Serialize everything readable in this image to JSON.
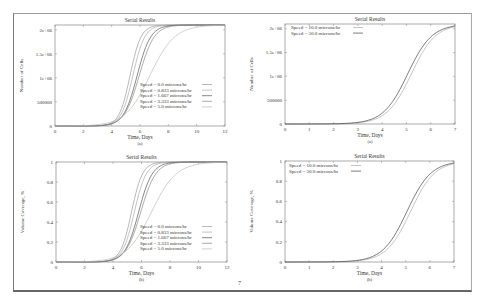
{
  "page": {
    "number": "7"
  },
  "chart_data": [
    {
      "id": "a",
      "type": "line",
      "title": "Serial Results",
      "xlabel": "Time, Days",
      "ylabel": "Number of Cells",
      "caption": "(a)",
      "xlim": [
        0,
        12
      ],
      "ylim": [
        0,
        2100000
      ],
      "xticks": [
        0,
        2,
        4,
        6,
        8,
        10,
        12
      ],
      "yticks": [
        {
          "v": 0,
          "label": "0"
        },
        {
          "v": 500000,
          "label": "500000"
        },
        {
          "v": 1000000,
          "label": "1e+06"
        },
        {
          "v": 1500000,
          "label": "1.5e+06"
        },
        {
          "v": 2000000,
          "label": "2e+06"
        }
      ],
      "legend_position": "lower right",
      "box": {
        "x": 55,
        "y": 25,
        "w": 170,
        "h": 101
      },
      "legend_box": {
        "x": 140,
        "y": 86
      },
      "series": [
        {
          "name": "Speed =  0.0  microns/hr",
          "max": 2100000,
          "mid": 5.3,
          "k": 2.6,
          "color": "#999"
        },
        {
          "name": "Speed = 0.833 microns/hr",
          "max": 2100000,
          "mid": 5.5,
          "k": 2.4,
          "color": "#aaa"
        },
        {
          "name": "Speed = 1.667 microns/hr",
          "max": 2100000,
          "mid": 5.8,
          "k": 2.1,
          "color": "#555"
        },
        {
          "name": "Speed = 3.333 microns/hr",
          "max": 2100000,
          "mid": 5.95,
          "k": 1.9,
          "color": "#888"
        },
        {
          "name": "Speed =  5.0  microns/hr",
          "max": 2100000,
          "mid": 6.7,
          "k": 1.15,
          "color": "#bbb"
        }
      ]
    },
    {
      "id": "c",
      "type": "line",
      "title": "Serial Results",
      "xlabel": "Time, Days",
      "ylabel": "Number of Cells",
      "caption": "(a)",
      "xlim": [
        0,
        7
      ],
      "ylim": [
        0,
        2100000
      ],
      "xticks": [
        0,
        1,
        2,
        3,
        4,
        5,
        6,
        7
      ],
      "yticks": [
        {
          "v": 0,
          "label": "0"
        },
        {
          "v": 500000,
          "label": "500000"
        },
        {
          "v": 1000000,
          "label": "1e+06"
        },
        {
          "v": 1500000,
          "label": "1.5e+06"
        },
        {
          "v": 2000000,
          "label": "2e+06"
        }
      ],
      "legend_position": "upper left",
      "box": {
        "x": 285,
        "y": 24,
        "w": 170,
        "h": 100
      },
      "legend_box": {
        "x": 291,
        "y": 29
      },
      "series": [
        {
          "name": "Speed = 10.0  microns/hr",
          "max": 2100000,
          "mid": 5.2,
          "k": 2.0,
          "color": "#aaa"
        },
        {
          "name": "Speed = 50.0  microns/hr",
          "max": 2100000,
          "mid": 5.05,
          "k": 2.0,
          "color": "#444"
        }
      ]
    },
    {
      "id": "b",
      "type": "line",
      "title": "Serial Results",
      "xlabel": "Time, Days",
      "ylabel": "Volume Coverage, %",
      "caption": "(b)",
      "xlim": [
        0,
        12
      ],
      "ylim": [
        0,
        1
      ],
      "xticks": [
        0,
        2,
        4,
        6,
        8,
        10,
        12
      ],
      "yticks": [
        {
          "v": 0,
          "label": "0"
        },
        {
          "v": 0.2,
          "label": "0.2"
        },
        {
          "v": 0.4,
          "label": "0.4"
        },
        {
          "v": 0.6,
          "label": "0.6"
        },
        {
          "v": 0.8,
          "label": "0.8"
        },
        {
          "v": 1,
          "label": "1"
        }
      ],
      "legend_position": "lower right",
      "box": {
        "x": 56,
        "y": 162,
        "w": 171,
        "h": 100
      },
      "legend_box": {
        "x": 140,
        "y": 228
      },
      "series": [
        {
          "name": "Speed =  0.0  microns/hr",
          "max": 1,
          "mid": 5.3,
          "k": 2.6,
          "color": "#999"
        },
        {
          "name": "Speed = 0.833 microns/hr",
          "max": 1,
          "mid": 5.5,
          "k": 2.4,
          "color": "#aaa"
        },
        {
          "name": "Speed = 1.667 microns/hr",
          "max": 1,
          "mid": 5.8,
          "k": 2.1,
          "color": "#555"
        },
        {
          "name": "Speed = 3.333 microns/hr",
          "max": 1,
          "mid": 5.95,
          "k": 1.9,
          "color": "#888"
        },
        {
          "name": "Speed =  5.0  microns/hr",
          "max": 1,
          "mid": 6.7,
          "k": 1.15,
          "color": "#bbb"
        }
      ]
    },
    {
      "id": "d",
      "type": "line",
      "title": "Serial Results",
      "xlabel": "Time, Days",
      "ylabel": "Volume Coverage, %",
      "caption": "(b)",
      "xlim": [
        0,
        7
      ],
      "ylim": [
        0,
        1
      ],
      "xticks": [
        0,
        1,
        2,
        3,
        4,
        5,
        6,
        7
      ],
      "yticks": [
        {
          "v": 0,
          "label": "0"
        },
        {
          "v": 0.2,
          "label": "0.2"
        },
        {
          "v": 0.4,
          "label": "0.4"
        },
        {
          "v": 0.6,
          "label": "0.6"
        },
        {
          "v": 0.8,
          "label": "0.8"
        },
        {
          "v": 1,
          "label": "1"
        }
      ],
      "legend_position": "upper left",
      "box": {
        "x": 285,
        "y": 161,
        "w": 169,
        "h": 101
      },
      "legend_box": {
        "x": 289,
        "y": 167
      },
      "series": [
        {
          "name": "Speed = 10.0  microns/hr",
          "max": 1,
          "mid": 5.2,
          "k": 2.0,
          "color": "#aaa"
        },
        {
          "name": "Speed = 50.0  microns/hr",
          "max": 1,
          "mid": 5.05,
          "k": 2.0,
          "color": "#444"
        }
      ]
    }
  ]
}
